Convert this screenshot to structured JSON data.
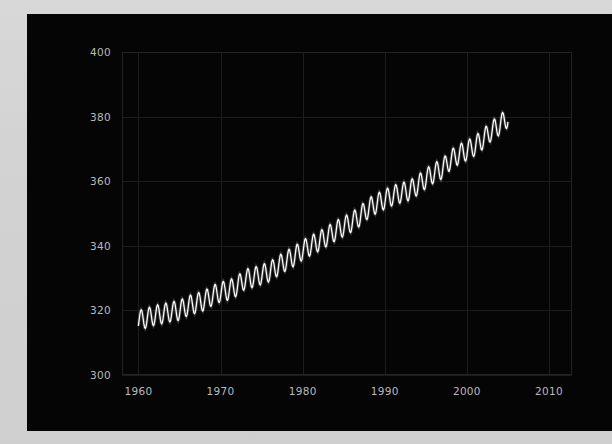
{
  "figure": {
    "background_color": "#050505",
    "page_background_color": "#d4d4d4",
    "tick_color": "#b9b9b9",
    "grid_color": "#1d1d1d",
    "line_color": "#ffffff"
  },
  "chart_data": {
    "type": "line",
    "title": "",
    "subtitle": "",
    "xlabel": "",
    "ylabel": "",
    "xlim": [
      1958,
      2012.8
    ],
    "ylim": [
      300,
      400
    ],
    "grid": true,
    "legend": null,
    "annotations": [],
    "xticks": [
      "1960",
      "1970",
      "1980",
      "1990",
      "2000",
      "2010"
    ],
    "xtick_values": [
      1960,
      1970,
      1980,
      1990,
      2000,
      2010
    ],
    "yticks": [
      "300",
      "320",
      "340",
      "360",
      "380",
      "400"
    ],
    "ytick_values": [
      300,
      320,
      340,
      360,
      380,
      400
    ],
    "series": [
      {
        "name": "Atmospheric CO2 (Mauna Loa)",
        "color": "#ffffff",
        "x_start": 1960.0,
        "x_end": 2005.0,
        "units": "ppm",
        "sampling": "monthly",
        "description": "Monthly mean CO2 concentration showing seasonal oscillation on a rising trend",
        "seasonal_amplitude_ppm": 3.1,
        "seasonal_peak_month": 5,
        "seasonal_trough_month": 10,
        "annual_mean_values": [
          316.9,
          317.6,
          318.5,
          319.0,
          319.6,
          320.0,
          321.4,
          322.2,
          323.0,
          324.6,
          325.7,
          326.3,
          327.5,
          329.7,
          330.2,
          331.1,
          332.0,
          333.8,
          335.4,
          336.8,
          338.7,
          340.1,
          341.4,
          343.0,
          344.6,
          346.0,
          347.4,
          349.2,
          351.6,
          353.1,
          354.4,
          355.6,
          356.4,
          357.1,
          358.8,
          360.8,
          362.6,
          363.8,
          366.6,
          368.3,
          369.5,
          371.0,
          373.1,
          375.6,
          377.4,
          379.8
        ],
        "annual_mean_years": [
          1960,
          1961,
          1962,
          1963,
          1964,
          1965,
          1966,
          1967,
          1968,
          1969,
          1970,
          1971,
          1972,
          1973,
          1974,
          1975,
          1976,
          1977,
          1978,
          1979,
          1980,
          1981,
          1982,
          1983,
          1984,
          1985,
          1986,
          1987,
          1988,
          1989,
          1990,
          1991,
          1992,
          1993,
          1994,
          1995,
          1996,
          1997,
          1998,
          1999,
          2000,
          2001,
          2002,
          2003,
          2004,
          2005
        ]
      }
    ]
  }
}
